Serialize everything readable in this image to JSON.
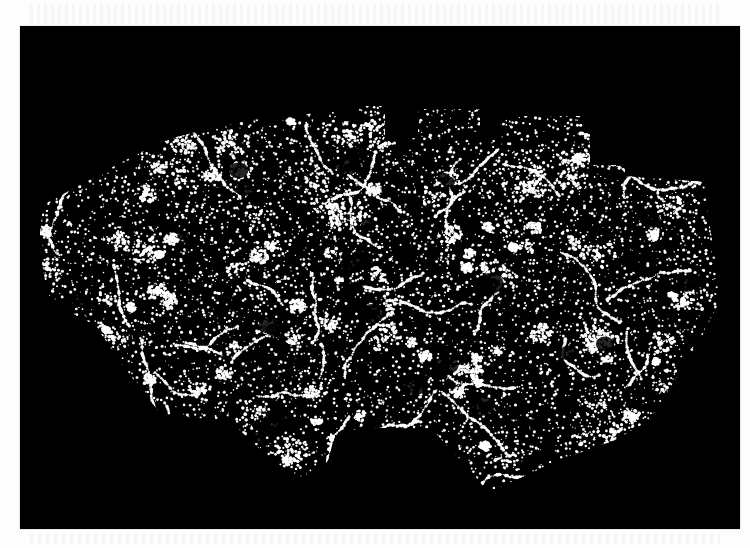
{
  "figure": {
    "background_color": "#000000",
    "point_color": "#ffffff",
    "page_color": "#fdfdfd",
    "panel": {
      "x": 20,
      "y": 26,
      "width": 720,
      "height": 503
    },
    "footprint_outline": [
      [
        43,
        205
      ],
      [
        80,
        185
      ],
      [
        120,
        163
      ],
      [
        165,
        140
      ],
      [
        215,
        127
      ],
      [
        270,
        117
      ],
      [
        352,
        110
      ],
      [
        352,
        106
      ],
      [
        385,
        106
      ],
      [
        385,
        138
      ],
      [
        418,
        138
      ],
      [
        418,
        109
      ],
      [
        480,
        109
      ],
      [
        480,
        140
      ],
      [
        500,
        140
      ],
      [
        500,
        116
      ],
      [
        590,
        116
      ],
      [
        590,
        165
      ],
      [
        625,
        165
      ],
      [
        625,
        176
      ],
      [
        705,
        182
      ],
      [
        708,
        215
      ],
      [
        712,
        240
      ],
      [
        716,
        265
      ],
      [
        720,
        300
      ],
      [
        700,
        340
      ],
      [
        675,
        380
      ],
      [
        650,
        420
      ],
      [
        615,
        440
      ],
      [
        560,
        460
      ],
      [
        520,
        478
      ],
      [
        488,
        492
      ],
      [
        470,
        470
      ],
      [
        448,
        447
      ],
      [
        433,
        430
      ],
      [
        400,
        428
      ],
      [
        360,
        428
      ],
      [
        335,
        435
      ],
      [
        328,
        460
      ],
      [
        322,
        470
      ],
      [
        300,
        478
      ],
      [
        272,
        460
      ],
      [
        250,
        440
      ],
      [
        230,
        420
      ],
      [
        195,
        418
      ],
      [
        160,
        413
      ],
      [
        130,
        375
      ],
      [
        95,
        325
      ],
      [
        70,
        312
      ],
      [
        48,
        300
      ],
      [
        42,
        262
      ],
      [
        40,
        235
      ]
    ],
    "legible_text": []
  }
}
